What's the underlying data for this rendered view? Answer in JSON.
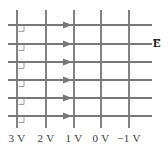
{
  "figure": {
    "name": "equipotential-and-field-line-diagram",
    "width": 168,
    "height": 151,
    "background": "#ffffff",
    "line_color": "#7d7d7d",
    "line_color_dark": "#6a6a6a",
    "text_color": "#3a3a3a",
    "label_color": "#1a1a1a"
  },
  "equipotentials": {
    "orientation": "vertical",
    "line_count": 5,
    "y_top": 10,
    "y_bottom": 128,
    "x_positions": [
      17,
      46,
      74,
      101,
      129
    ],
    "labels": [
      {
        "text": "3 V",
        "value": 3,
        "unit": "V",
        "x": 17
      },
      {
        "text": "2 V",
        "value": 2,
        "unit": "V",
        "x": 46
      },
      {
        "text": "1 V",
        "value": 1,
        "unit": "V",
        "x": 74
      },
      {
        "text": "0 V",
        "value": 0,
        "unit": "V",
        "x": 101
      },
      {
        "text": "−1 V",
        "value": -1,
        "unit": "V",
        "x": 129
      }
    ],
    "label_baseline_y": 134
  },
  "field_lines": {
    "orientation": "horizontal",
    "direction": "right",
    "line_count": 6,
    "x_start": 8,
    "x_end": 152,
    "y_positions": [
      25,
      44,
      62,
      80,
      98,
      116
    ],
    "arrow_tip_x": 72,
    "arrow_half_height": 3.4,
    "arrow_length": 9
  },
  "right_angle_marks": {
    "count": 6,
    "size": 6,
    "at_x": 17,
    "y_positions": [
      25,
      44,
      62,
      80,
      98,
      116
    ],
    "description": "small square corner marks showing field lines meet equipotentials at 90 degrees"
  },
  "field_vector_label": {
    "symbol": "E",
    "text": "E",
    "has_vector_arrow": true,
    "x": 152,
    "y": 38
  }
}
